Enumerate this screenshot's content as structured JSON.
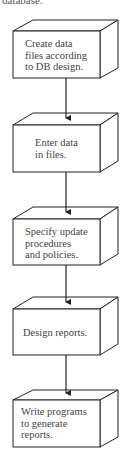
{
  "header_fragment": "database.",
  "steps": [
    {
      "lines": [
        "Create data",
        "files according",
        "to DB design."
      ]
    },
    {
      "lines": [
        "Enter data",
        "in files."
      ]
    },
    {
      "lines": [
        "Specify update",
        "procedures",
        "and policies."
      ]
    },
    {
      "lines": [
        "Design reports."
      ]
    },
    {
      "lines": [
        "Write programs",
        "to generate",
        "reports."
      ]
    }
  ]
}
